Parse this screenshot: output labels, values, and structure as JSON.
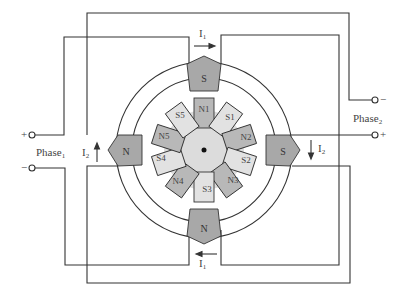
{
  "diagram": {
    "stator_poles": [
      {
        "id": "top",
        "label": "S"
      },
      {
        "id": "left",
        "label": "N"
      },
      {
        "id": "right",
        "label": "S"
      },
      {
        "id": "bottom",
        "label": "N"
      }
    ],
    "rotor_teeth": [
      "N1",
      "S1",
      "N2",
      "S2",
      "N3",
      "S3",
      "N4",
      "S4",
      "N5",
      "S5"
    ],
    "phase1": {
      "label": "Phase",
      "sub": "1",
      "plus": "+",
      "minus": "−"
    },
    "phase2": {
      "label": "Phase",
      "sub": "2",
      "plus": "+",
      "minus": "−"
    },
    "currents": {
      "i1_top": {
        "label": "I",
        "sub": "1",
        "direction": "right"
      },
      "i1_bottom": {
        "label": "I",
        "sub": "1",
        "direction": "left"
      },
      "i2_left": {
        "label": "I",
        "sub": "2",
        "direction": "up"
      },
      "i2_right": {
        "label": "I",
        "sub": "2",
        "direction": "down"
      }
    },
    "colors": {
      "stator_pole": "#a8a8a8",
      "rotor_body": "#dcdcdc",
      "rotor_n_tooth": "#b8b8b8",
      "rotor_s_tooth": "#e2e2e2",
      "wire": "#333333"
    }
  }
}
